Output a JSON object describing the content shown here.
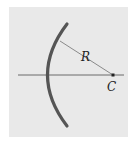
{
  "diagram": {
    "labels": {
      "radius": "R",
      "center": "C"
    },
    "colors": {
      "background": "#e9e9e9",
      "mirror": "#555555",
      "axis": "#666666",
      "radius_line": "#888888",
      "center_point": "#222222"
    }
  }
}
